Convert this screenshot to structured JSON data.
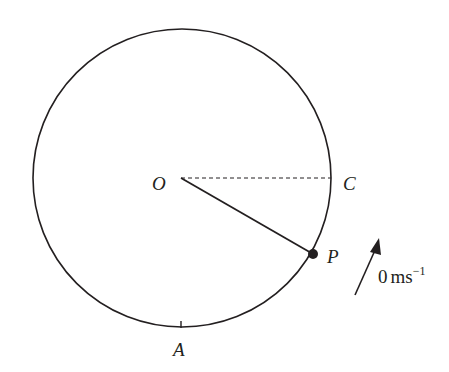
{
  "diagram": {
    "type": "circle-motion",
    "labels": {
      "centre": "O",
      "point_c": "C",
      "point_p": "P",
      "point_a": "A"
    },
    "velocity": {
      "value": "0",
      "unit": "ms",
      "exponent": "−1"
    },
    "colors": {
      "stroke": "#231f20",
      "background": "#ffffff"
    }
  }
}
